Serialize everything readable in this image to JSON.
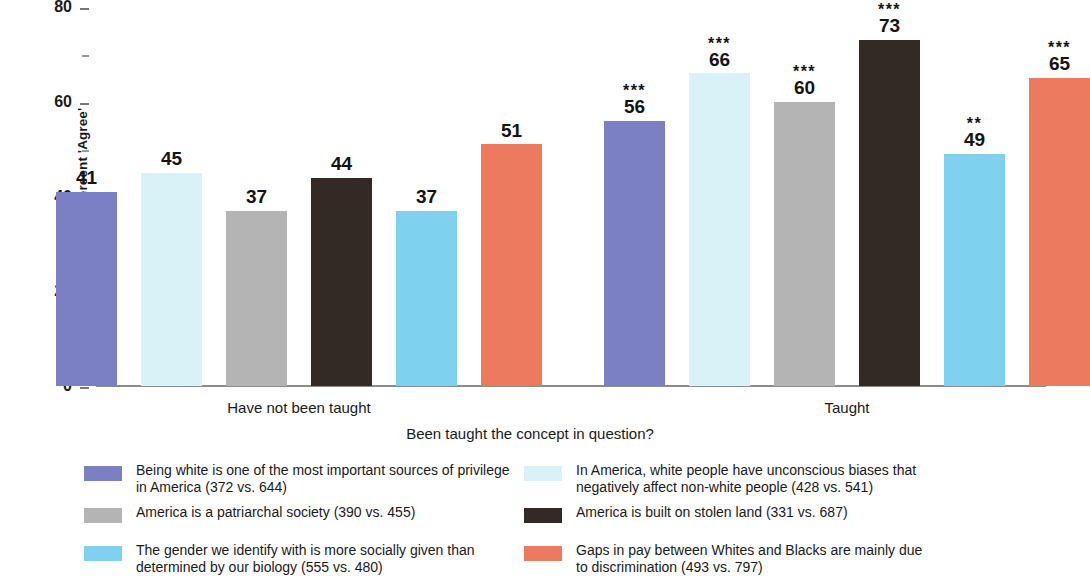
{
  "chart_data": {
    "type": "bar",
    "title": "",
    "xlabel": "Been taught the concept in question?",
    "ylabel": "Percent 'Agree'",
    "ylim": [
      0,
      80
    ],
    "ytick_labels": [
      "0",
      "20",
      "40",
      "60",
      "80"
    ],
    "ytick_values": [
      0,
      20,
      40,
      60,
      80
    ],
    "yminor_values": [
      10,
      30,
      50,
      70
    ],
    "grid": false,
    "legend_position": "bottom",
    "categories": [
      "Have not been taught",
      "Taught"
    ],
    "series": [
      {
        "name": "Being white is one of the most important sources of privilege\nin America (372 vs. 644)",
        "color": "#7b80c4",
        "values": [
          41,
          45
        ],
        "significance": [
          "",
          "***"
        ]
      },
      {
        "name": "In America, white people have unconscious biases that\nnegatively affect non-white people (428 vs. 541)",
        "color": "#d9f2f8",
        "values": [
          45,
          66
        ],
        "significance": [
          "",
          "***"
        ]
      },
      {
        "name": "America is a patriarchal society (390 vs. 455)",
        "color": "#b4b4b4",
        "values": [
          37,
          60
        ],
        "significance": [
          "",
          "***"
        ]
      },
      {
        "name": "America is built on stolen land (331 vs. 687)",
        "color": "#332a26",
        "values": [
          44,
          73
        ],
        "significance": [
          "",
          "***"
        ]
      },
      {
        "name": "The gender we identify with is more socially given than\ndetermined by our biology (555 vs. 480)",
        "color": "#7ed2ef",
        "values": [
          37,
          49
        ],
        "significance": [
          "",
          "**"
        ]
      },
      {
        "name": "Gaps in pay between Whites and Blacks are mainly due\nto discrimination (493 vs. 797)",
        "color": "#ec7a5e",
        "values": [
          51,
          65
        ],
        "significance": [
          "",
          "***"
        ]
      }
    ],
    "bars_flat": [
      {
        "value": 41,
        "stars": "",
        "color": "#7b80c4",
        "group": "Have not been taught"
      },
      {
        "value": 45,
        "stars": "",
        "color": "#d9f2f8",
        "group": "Have not been taught"
      },
      {
        "value": 37,
        "stars": "",
        "color": "#b4b4b4",
        "group": "Have not been taught"
      },
      {
        "value": 44,
        "stars": "",
        "color": "#332a26",
        "group": "Have not been taught"
      },
      {
        "value": 37,
        "stars": "",
        "color": "#7ed2ef",
        "group": "Have not been taught"
      },
      {
        "value": 51,
        "stars": "",
        "color": "#ec7a5e",
        "group": "Have not been taught"
      },
      {
        "value": 56,
        "stars": "***",
        "color": "#7b80c4",
        "group": "Taught"
      },
      {
        "value": 66,
        "stars": "***",
        "color": "#d9f2f8",
        "group": "Taught"
      },
      {
        "value": 60,
        "stars": "***",
        "color": "#b4b4b4",
        "group": "Taught"
      },
      {
        "value": 73,
        "stars": "***",
        "color": "#332a26",
        "group": "Taught"
      },
      {
        "value": 49,
        "stars": "**",
        "color": "#7ed2ef",
        "group": "Taught"
      },
      {
        "value": 65,
        "stars": "***",
        "color": "#ec7a5e",
        "group": "Taught"
      }
    ]
  },
  "legend": {
    "left_column": [
      {
        "label": "Being white is one of the most important sources of privilege\nin America (372 vs. 644)",
        "color": "#7b80c4"
      },
      {
        "label": "America is a patriarchal society (390 vs. 455)",
        "color": "#b4b4b4"
      },
      {
        "label": "The gender we identify with is more socially given than\ndetermined by our biology (555 vs. 480)",
        "color": "#7ed2ef"
      }
    ],
    "right_column": [
      {
        "label": "In America, white people have unconscious biases that\nnegatively affect non-white people (428 vs. 541)",
        "color": "#d9f2f8"
      },
      {
        "label": "America is built on stolen land (331 vs. 687)",
        "color": "#332a26"
      },
      {
        "label": "Gaps in pay between Whites and Blacks are mainly due\nto discrimination (493 vs. 797)",
        "color": "#ec7a5e"
      }
    ]
  }
}
